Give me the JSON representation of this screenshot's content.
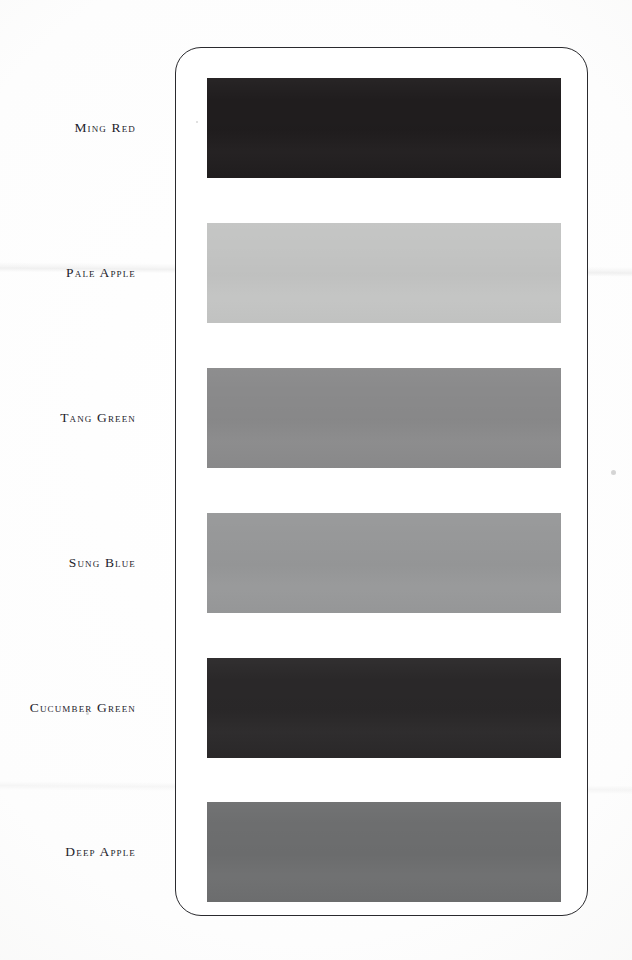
{
  "page": {
    "background_color": "#fdfdfd",
    "plate_border_color": "#2a2a2e",
    "plate_fill_color": "#ffffff"
  },
  "swatches": [
    {
      "label": "Ming Red",
      "color": "#201d1e",
      "top": 78
    },
    {
      "label": "Pale Apple",
      "color": "#c3c4c3",
      "top": 223
    },
    {
      "label": "Tang Green",
      "color": "#8a8a8b",
      "top": 368
    },
    {
      "label": "Sung Blue",
      "color": "#979899",
      "top": 513
    },
    {
      "label": "Cucumber Green",
      "color": "#2a2829",
      "top": 658
    },
    {
      "label": "Deep Apple",
      "color": "#6d6e6f",
      "top": 802
    }
  ],
  "artifacts": {
    "scan_line_upper": "faint-horizontal-band",
    "scan_line_lower": "faint-horizontal-band",
    "specks": [
      {
        "x": 611,
        "y": 470,
        "size": 5
      },
      {
        "x": 86,
        "y": 712,
        "size": 3
      },
      {
        "x": 196,
        "y": 121,
        "size": 2
      }
    ]
  }
}
